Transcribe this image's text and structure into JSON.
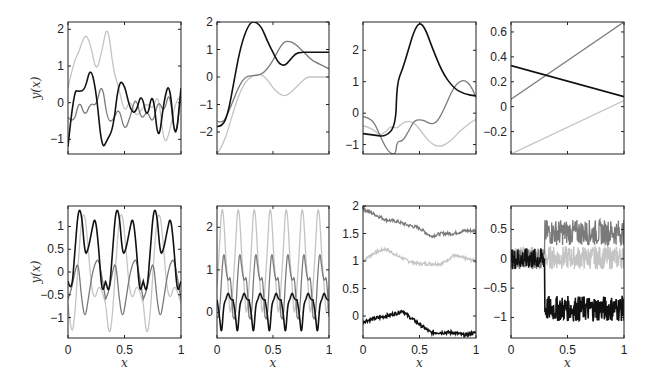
{
  "figure": {
    "ylabel": "y(x)",
    "xlabel": "x",
    "colors": {
      "dark": "#111111",
      "mid": "#7a7a7a",
      "light": "#c4c4c4"
    }
  },
  "chart_data": [
    {
      "type": "line",
      "row": 1,
      "col": 1,
      "ylabel": "y(x)",
      "xlim": [
        0,
        1
      ],
      "ylim": [
        -1.4,
        2.2
      ],
      "yticks": [
        -1,
        0,
        1,
        2
      ],
      "series": [
        {
          "name": "dark",
          "x": [
            0,
            0.05,
            0.1,
            0.15,
            0.2,
            0.25,
            0.3,
            0.35,
            0.4,
            0.45,
            0.5,
            0.55,
            0.6,
            0.65,
            0.7,
            0.75,
            0.8,
            0.85,
            0.9,
            0.95,
            1
          ],
          "values": [
            -1.2,
            0.35,
            0.3,
            0.35,
            1.0,
            0.3,
            -1.3,
            -1.0,
            -0.7,
            0.6,
            0.5,
            -0.2,
            -0.3,
            0.3,
            -0.5,
            0.4,
            -1.2,
            0.1,
            0.6,
            -1.2,
            0.4
          ]
        },
        {
          "name": "mid",
          "x": [
            0,
            0.05,
            0.1,
            0.15,
            0.2,
            0.25,
            0.3,
            0.35,
            0.4,
            0.45,
            0.5,
            0.55,
            0.6,
            0.65,
            0.7,
            0.75,
            0.8,
            0.85,
            0.9,
            0.95,
            1
          ],
          "values": [
            -0.4,
            -0.6,
            0.1,
            -0.4,
            0.0,
            -0.1,
            0.6,
            -0.5,
            -0.5,
            -0.1,
            -0.8,
            -0.4,
            0.2,
            -0.5,
            -0.2,
            -0.6,
            0.1,
            -0.3,
            0.4,
            -1.2,
            0.3
          ]
        },
        {
          "name": "light",
          "x": [
            0,
            0.05,
            0.1,
            0.15,
            0.2,
            0.25,
            0.3,
            0.35,
            0.4,
            0.45,
            0.5,
            0.55,
            0.6,
            0.65,
            0.7,
            0.75,
            0.8,
            0.85,
            0.9,
            0.95,
            1
          ],
          "values": [
            0.4,
            1.1,
            1.4,
            1.9,
            1.6,
            0.8,
            1.4,
            2.2,
            0.9,
            0.4,
            -0.3,
            0.1,
            -0.4,
            -0.2,
            0.0,
            -0.2,
            0.3,
            -1.2,
            -0.8,
            0.0,
            0.2
          ]
        }
      ]
    },
    {
      "type": "line",
      "row": 1,
      "col": 2,
      "xlim": [
        0,
        1
      ],
      "ylim": [
        -2.8,
        2.0
      ],
      "yticks": [
        -2,
        -1,
        0,
        1,
        2
      ],
      "series": [
        {
          "name": "dark",
          "x": [
            0,
            0.05,
            0.1,
            0.15,
            0.2,
            0.25,
            0.3,
            0.35,
            0.4,
            0.45,
            0.5,
            0.55,
            0.6,
            0.65,
            0.7,
            0.75,
            0.8,
            0.85,
            0.9,
            0.95,
            1
          ],
          "values": [
            -1.8,
            -1.8,
            -1.3,
            -0.2,
            0.9,
            1.6,
            2.0,
            2.0,
            1.8,
            1.3,
            0.9,
            0.5,
            0.4,
            0.6,
            0.85,
            0.9,
            0.9,
            0.9,
            0.9,
            0.9,
            0.9
          ]
        },
        {
          "name": "mid",
          "x": [
            0,
            0.05,
            0.1,
            0.15,
            0.2,
            0.25,
            0.3,
            0.35,
            0.4,
            0.45,
            0.5,
            0.55,
            0.6,
            0.65,
            0.7,
            0.75,
            0.8,
            0.85,
            0.9,
            0.95,
            1
          ],
          "values": [
            -1.6,
            -1.7,
            -1.3,
            -0.8,
            -0.3,
            0.0,
            0.05,
            0.05,
            0.1,
            0.3,
            0.6,
            1.0,
            1.3,
            1.3,
            1.2,
            1.0,
            0.8,
            0.6,
            0.5,
            0.4,
            0.3
          ]
        },
        {
          "name": "light",
          "x": [
            0,
            0.05,
            0.1,
            0.15,
            0.2,
            0.25,
            0.3,
            0.35,
            0.4,
            0.45,
            0.5,
            0.55,
            0.6,
            0.65,
            0.7,
            0.75,
            0.8,
            0.85,
            0.9,
            0.95,
            1
          ],
          "values": [
            -2.8,
            -2.5,
            -1.9,
            -1.2,
            -0.6,
            -0.2,
            0.0,
            0.1,
            0.1,
            -0.1,
            -0.4,
            -0.6,
            -0.7,
            -0.6,
            -0.4,
            -0.2,
            0.0,
            0.0,
            0.0,
            0.0,
            0.0
          ]
        }
      ]
    },
    {
      "type": "line",
      "row": 1,
      "col": 3,
      "xlim": [
        0,
        1
      ],
      "ylim": [
        -1.3,
        2.9
      ],
      "yticks": [
        -1,
        0,
        1,
        2
      ],
      "series": [
        {
          "name": "dark",
          "x": [
            0,
            0.1,
            0.2,
            0.29,
            0.3,
            0.35,
            0.4,
            0.45,
            0.5,
            0.55,
            0.6,
            0.7,
            0.8,
            0.9,
            1
          ],
          "values": [
            -0.65,
            -0.7,
            -0.75,
            -0.4,
            0.95,
            1.4,
            2.0,
            2.6,
            2.9,
            2.7,
            2.2,
            1.3,
            0.8,
            0.6,
            0.55
          ]
        },
        {
          "name": "mid",
          "x": [
            0,
            0.05,
            0.1,
            0.15,
            0.2,
            0.25,
            0.29,
            0.3,
            0.35,
            0.4,
            0.45,
            0.5,
            0.55,
            0.6,
            0.65,
            0.7,
            0.75,
            0.8,
            0.85,
            0.9,
            0.95,
            1
          ],
          "values": [
            -0.1,
            -0.15,
            -0.3,
            -0.7,
            -1.1,
            -1.3,
            -1.3,
            -0.9,
            -0.9,
            -0.6,
            -0.25,
            -0.2,
            -0.25,
            -0.35,
            -0.3,
            0.0,
            0.4,
            0.8,
            1.0,
            1.05,
            0.9,
            0.5
          ]
        },
        {
          "name": "light",
          "x": [
            0,
            0.05,
            0.1,
            0.15,
            0.2,
            0.25,
            0.3,
            0.35,
            0.4,
            0.45,
            0.5,
            0.55,
            0.6,
            0.65,
            0.7,
            0.75,
            0.8,
            0.85,
            0.9,
            0.95,
            1
          ],
          "values": [
            -0.4,
            -0.45,
            -0.55,
            -0.7,
            -0.6,
            -0.4,
            -0.5,
            -0.3,
            -0.25,
            -0.3,
            -0.5,
            -0.75,
            -0.95,
            -1.05,
            -1.05,
            -0.95,
            -0.8,
            -0.6,
            -0.45,
            -0.3,
            -0.2
          ]
        }
      ]
    },
    {
      "type": "line",
      "row": 1,
      "col": 4,
      "xlim": [
        0,
        1
      ],
      "ylim": [
        -0.38,
        0.68
      ],
      "yticks": [
        -0.2,
        0,
        0.2,
        0.4,
        0.6
      ],
      "series": [
        {
          "name": "dark",
          "x": [
            0,
            1
          ],
          "values": [
            0.33,
            0.08
          ]
        },
        {
          "name": "mid",
          "x": [
            0,
            1
          ],
          "values": [
            0.06,
            0.68
          ]
        },
        {
          "name": "light",
          "x": [
            0,
            1
          ],
          "values": [
            -0.38,
            0.05
          ]
        }
      ]
    },
    {
      "type": "line",
      "row": 2,
      "col": 1,
      "ylabel": "y(x)",
      "xlabel": "x",
      "xlim": [
        0,
        1
      ],
      "ylim": [
        -1.45,
        1.45
      ],
      "yticks": [
        -1,
        -0.5,
        0,
        0.5,
        1
      ],
      "xticks": [
        0,
        0.5,
        1
      ],
      "note": "periodic, period ~1/3",
      "series": [
        {
          "name": "dark",
          "x": [
            0,
            0.03,
            0.06,
            0.09,
            0.12,
            0.15,
            0.18,
            0.21,
            0.24,
            0.27,
            0.3,
            0.333
          ],
          "values": [
            -0.2,
            -0.5,
            0.4,
            1.4,
            1.3,
            0.35,
            0.5,
            0.9,
            1.25,
            0.6,
            -0.5,
            -0.2
          ]
        },
        {
          "name": "mid",
          "x": [
            0,
            0.03,
            0.06,
            0.09,
            0.12,
            0.15,
            0.18,
            0.21,
            0.24,
            0.27,
            0.3,
            0.333
          ],
          "values": [
            -0.6,
            -0.4,
            0.0,
            0.25,
            -0.6,
            -1.05,
            -0.6,
            -0.1,
            0.2,
            0.3,
            -0.1,
            -0.6
          ]
        },
        {
          "name": "light",
          "x": [
            0,
            0.03,
            0.06,
            0.09,
            0.12,
            0.15,
            0.18,
            0.21,
            0.24,
            0.27,
            0.3,
            0.333
          ],
          "values": [
            -0.7,
            -1.45,
            -1.0,
            0.2,
            1.2,
            1.3,
            0.5,
            -0.4,
            -0.6,
            -0.3,
            -0.4,
            -0.7
          ]
        }
      ]
    },
    {
      "type": "line",
      "row": 2,
      "col": 2,
      "xlabel": "x",
      "xlim": [
        0,
        1
      ],
      "ylim": [
        -0.6,
        2.5
      ],
      "yticks": [
        0,
        1,
        2
      ],
      "xticks": [
        0,
        0.5,
        1
      ],
      "note": "periodic, period ~1/7",
      "series": [
        {
          "name": "dark",
          "x": [
            0,
            0.02,
            0.04,
            0.06,
            0.08,
            0.1,
            0.12,
            0.143
          ],
          "values": [
            0.3,
            0.0,
            -0.6,
            0.2,
            0.3,
            0.5,
            0.3,
            0.3
          ]
        },
        {
          "name": "mid",
          "x": [
            0,
            0.02,
            0.04,
            0.06,
            0.08,
            0.1,
            0.12,
            0.143
          ],
          "values": [
            -0.1,
            -0.2,
            0.8,
            1.5,
            1.0,
            0.7,
            0.9,
            -0.1
          ]
        },
        {
          "name": "light",
          "x": [
            0,
            0.02,
            0.04,
            0.06,
            0.08,
            0.1,
            0.12,
            0.143
          ],
          "values": [
            0.6,
            1.4,
            2.5,
            2.3,
            1.2,
            0.6,
            -0.2,
            0.6
          ]
        }
      ]
    },
    {
      "type": "line",
      "row": 2,
      "col": 3,
      "xlabel": "x",
      "xlim": [
        0,
        1
      ],
      "ylim": [
        -0.4,
        2.0
      ],
      "yticks": [
        0,
        0.5,
        1,
        1.5,
        2
      ],
      "xticks": [
        0,
        0.5,
        1
      ],
      "series": [
        {
          "name": "dark",
          "x": [
            0,
            0.1,
            0.2,
            0.3,
            0.35,
            0.4,
            0.5,
            0.6,
            0.7,
            0.8,
            0.9,
            1
          ],
          "values": [
            -0.1,
            -0.05,
            0.0,
            0.05,
            0.1,
            0.0,
            -0.15,
            -0.3,
            -0.3,
            -0.3,
            -0.35,
            -0.3
          ]
        },
        {
          "name": "mid",
          "x": [
            0,
            0.1,
            0.2,
            0.3,
            0.4,
            0.5,
            0.6,
            0.7,
            0.8,
            0.9,
            1
          ],
          "values": [
            1.95,
            1.85,
            1.75,
            1.72,
            1.65,
            1.6,
            1.45,
            1.5,
            1.5,
            1.55,
            1.55
          ]
        },
        {
          "name": "light",
          "x": [
            0,
            0.1,
            0.2,
            0.3,
            0.4,
            0.5,
            0.6,
            0.7,
            0.8,
            0.9,
            1
          ],
          "values": [
            1.0,
            1.15,
            1.22,
            1.1,
            1.0,
            0.95,
            0.95,
            0.95,
            1.1,
            1.05,
            1.0
          ]
        }
      ]
    },
    {
      "type": "line",
      "row": 2,
      "col": 4,
      "xlabel": "x",
      "xlim": [
        0,
        1
      ],
      "ylim": [
        -1.35,
        0.9
      ],
      "yticks": [
        -1,
        -0.5,
        0,
        0.5
      ],
      "xticks": [
        0,
        0.5,
        1
      ],
      "note": "noisy; jump at x~0.3",
      "series": [
        {
          "name": "dark",
          "x": [
            0,
            0.3,
            0.3,
            1
          ],
          "values": [
            0.0,
            0.0,
            -0.85,
            -0.85
          ]
        },
        {
          "name": "mid",
          "x": [
            0,
            0.3,
            0.3,
            1
          ],
          "values": [
            0.0,
            0.0,
            0.45,
            0.45
          ]
        },
        {
          "name": "light",
          "x": [
            0,
            1
          ],
          "values": [
            0.0,
            0.05
          ]
        }
      ]
    }
  ]
}
